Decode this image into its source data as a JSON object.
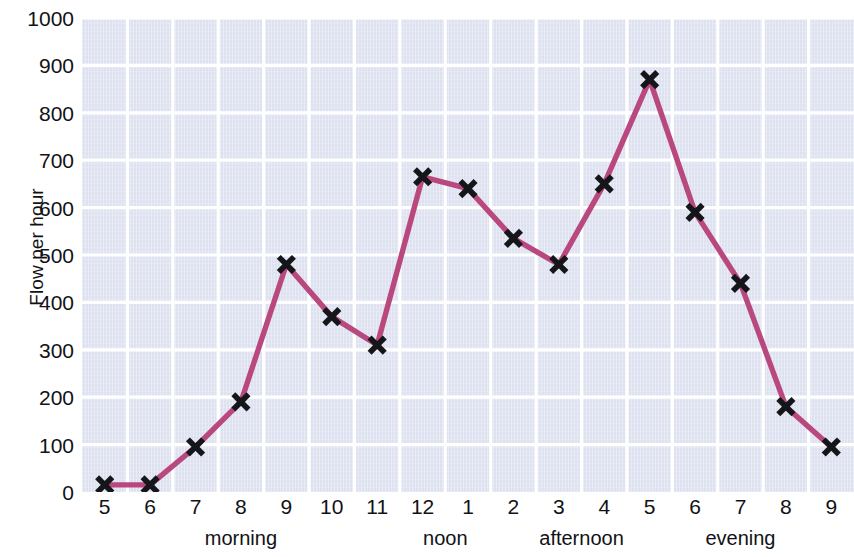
{
  "chart_data": {
    "type": "line",
    "title": "",
    "subtitle": "",
    "xlabel": "",
    "ylabel": "Flow per hour",
    "x": [
      "5",
      "6",
      "7",
      "8",
      "9",
      "10",
      "11",
      "12",
      "1",
      "2",
      "3",
      "4",
      "5",
      "6",
      "7",
      "8",
      "9"
    ],
    "categories": [
      "5",
      "6",
      "7",
      "8",
      "9",
      "10",
      "11",
      "12",
      "1",
      "2",
      "3",
      "4",
      "5",
      "6",
      "7",
      "8",
      "9"
    ],
    "values": [
      15,
      15,
      95,
      190,
      480,
      370,
      310,
      665,
      640,
      535,
      480,
      650,
      870,
      590,
      440,
      180,
      95
    ],
    "series": [
      {
        "name": "Flow per hour",
        "values": [
          15,
          15,
          95,
          190,
          480,
          370,
          310,
          665,
          640,
          535,
          480,
          650,
          870,
          590,
          440,
          180,
          95
        ]
      }
    ],
    "ylim": [
      0,
      1000
    ],
    "y_ticks": [
      0,
      100,
      200,
      300,
      400,
      500,
      600,
      700,
      800,
      900,
      1000
    ],
    "y_tick_labels": [
      "0",
      "100",
      "200",
      "300",
      "400",
      "500",
      "600",
      "700",
      "800",
      "900",
      "1000"
    ],
    "x_tick_labels": [
      "5",
      "6",
      "7",
      "8",
      "9",
      "10",
      "11",
      "12",
      "1",
      "2",
      "3",
      "4",
      "5",
      "6",
      "7",
      "8",
      "9"
    ],
    "period_labels": [
      {
        "label": "morning",
        "center_index": 3
      },
      {
        "label": "noon",
        "center_index": 7.5
      },
      {
        "label": "afternoon",
        "center_index": 10.5
      },
      {
        "label": "evening",
        "center_index": 14
      }
    ],
    "grid": true,
    "grid_color": "#ffffff",
    "legend": false,
    "legend_position": "none",
    "marker": "x",
    "marker_color": "#15161a",
    "line_color": "#b9487e",
    "plot_background": "#dee2f0",
    "page_background": "#ffffff",
    "annotations": []
  }
}
